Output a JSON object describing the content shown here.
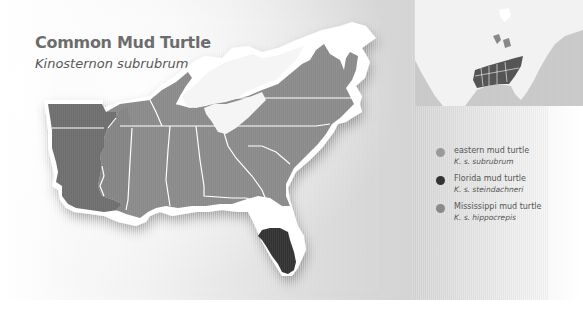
{
  "title": "Common Mud Turtle",
  "subtitle": "Kinosternon subrubrum",
  "legend": [
    {
      "name": "eastern mud turtle",
      "scientific": "K. s. subrubrum",
      "color": "#999999"
    },
    {
      "name": "Florida mud turtle",
      "scientific": "K. s. steindachneri",
      "color": "#333333"
    },
    {
      "name": "Mississippi mud turtle",
      "scientific": "K. s. hippocrepis",
      "color": "#8a8a8a"
    }
  ],
  "colors": {
    "eastern": "#8c8c8c",
    "florida": "#333333",
    "mississippi": "#6f6f6f",
    "mississippi_light": "#858585",
    "border": "#ffffff",
    "land_unoccupied": "#f4f4f4"
  },
  "inset": {
    "label": "North America locator map"
  }
}
